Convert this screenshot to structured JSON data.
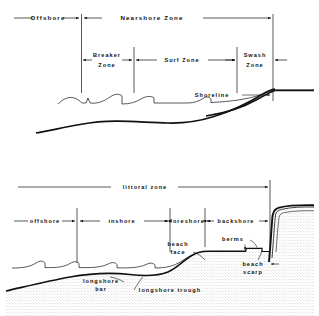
{
  "figure": {
    "ink_color": "#111111",
    "background_color": "#ffffff"
  },
  "upper_diagram": {
    "row1": [
      {
        "label": "Offshore",
        "x_start": 14,
        "x_end": 81
      },
      {
        "label": "Nearshore   Zone",
        "x_start": 81,
        "x_end": 273
      }
    ],
    "row2": [
      {
        "label_line1": "Breaker",
        "label_line2": "Zone",
        "x_start": 81,
        "x_end": 134
      },
      {
        "label_line1": "Surf  Zone",
        "label_line2": "",
        "x_start": 134,
        "x_end": 237
      },
      {
        "label_line1": "Swash",
        "label_line2": "Zone",
        "x_start": 237,
        "x_end": 273
      }
    ],
    "callouts": [
      {
        "label": "Shoreline",
        "x": 212,
        "y": 95
      }
    ]
  },
  "lower_diagram": {
    "row1": [
      {
        "label": "littoral   zone",
        "x_start": 18,
        "x_end": 270
      }
    ],
    "row2": [
      {
        "label": "offshore",
        "x_start": 14,
        "x_end": 77
      },
      {
        "label": "inshore",
        "x_start": 77,
        "x_end": 170
      },
      {
        "label": "foreshore",
        "x_start": 170,
        "x_end": 205
      },
      {
        "label": "backshore",
        "x_start": 205,
        "x_end": 270
      }
    ],
    "callouts": [
      {
        "label_line1": "beach",
        "label_line2": "face",
        "x": 163,
        "y": 244
      },
      {
        "label_line1": "berms",
        "label_line2": "",
        "x": 222,
        "y": 239
      },
      {
        "label_line1": "beach",
        "label_line2": "scarp",
        "x": 240,
        "y": 268
      },
      {
        "label_line1": "longshore",
        "label_line2": "bar",
        "x": 82,
        "y": 281
      },
      {
        "label_line1": "longshore trough",
        "label_line2": "",
        "x": 133,
        "y": 292
      }
    ]
  }
}
